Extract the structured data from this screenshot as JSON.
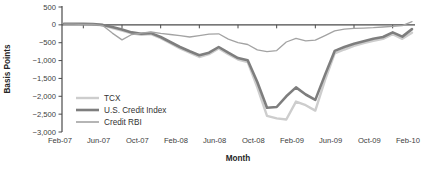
{
  "chart_data": {
    "type": "line",
    "title": "",
    "xlabel": "Month",
    "ylabel": "Basis Points",
    "ylim": [
      -3000,
      500
    ],
    "ytick_step": 500,
    "y_tick_labels": [
      "500",
      "0",
      "−500",
      "−1,000",
      "−1,500",
      "−2,000",
      "−2,500",
      "−3,000"
    ],
    "y_tick_values": [
      500,
      0,
      -500,
      -1000,
      -1500,
      -2000,
      -2500,
      -3000
    ],
    "x_categories": [
      "Feb-07",
      "Mar-07",
      "Apr-07",
      "May-07",
      "Jun-07",
      "Jul-07",
      "Aug-07",
      "Sep-07",
      "Oct-07",
      "Nov-07",
      "Dec-07",
      "Jan-08",
      "Feb-08",
      "Mar-08",
      "Apr-08",
      "May-08",
      "Jun-08",
      "Jul-08",
      "Aug-08",
      "Sep-08",
      "Oct-08",
      "Nov-08",
      "Dec-08",
      "Jan-09",
      "Feb-09",
      "Mar-09",
      "Apr-09",
      "May-09",
      "Jun-09",
      "Jul-09",
      "Aug-09",
      "Sep-09",
      "Oct-09",
      "Nov-09",
      "Dec-09",
      "Jan-10",
      "Feb-10"
    ],
    "x_tick_labels": [
      "Feb-07",
      "Jun-07",
      "Oct-07",
      "Feb-08",
      "Jun-08",
      "Oct-08",
      "Feb-09",
      "Jun-09",
      "Oct-09",
      "Feb-10"
    ],
    "grid": false,
    "legend_position": "inside-left",
    "axis_color": "#4a4a4a",
    "series": [
      {
        "name": "TCX",
        "color": "#cdcdcd",
        "stroke_width": 2.4,
        "values": [
          20,
          20,
          20,
          10,
          -10,
          -90,
          -160,
          -240,
          -280,
          -260,
          -370,
          -510,
          -660,
          -780,
          -900,
          -820,
          -660,
          -820,
          -970,
          -1040,
          -1750,
          -2550,
          -2620,
          -2650,
          -2150,
          -2250,
          -2400,
          -1550,
          -800,
          -690,
          -590,
          -510,
          -450,
          -390,
          -260,
          -390,
          -220
        ]
      },
      {
        "name": "U.S. Credit Index",
        "color": "#7e7e7e",
        "stroke_width": 2.6,
        "values": [
          30,
          30,
          30,
          20,
          0,
          -60,
          -130,
          -210,
          -250,
          -230,
          -340,
          -480,
          -620,
          -740,
          -850,
          -780,
          -620,
          -780,
          -930,
          -990,
          -1600,
          -2320,
          -2300,
          -2000,
          -1750,
          -1950,
          -2100,
          -1400,
          -730,
          -620,
          -530,
          -460,
          -390,
          -340,
          -210,
          -330,
          -120
        ]
      },
      {
        "name": "Credit RBI",
        "color": "#a3a3a3",
        "stroke_width": 1.3,
        "values": [
          20,
          20,
          10,
          10,
          -20,
          -230,
          -420,
          -270,
          -230,
          -200,
          -240,
          -270,
          -300,
          -340,
          -300,
          -260,
          -250,
          -400,
          -500,
          -550,
          -700,
          -750,
          -720,
          -480,
          -380,
          -450,
          -430,
          -300,
          -170,
          -120,
          -100,
          -90,
          -80,
          -60,
          -40,
          -20,
          90
        ]
      }
    ]
  }
}
